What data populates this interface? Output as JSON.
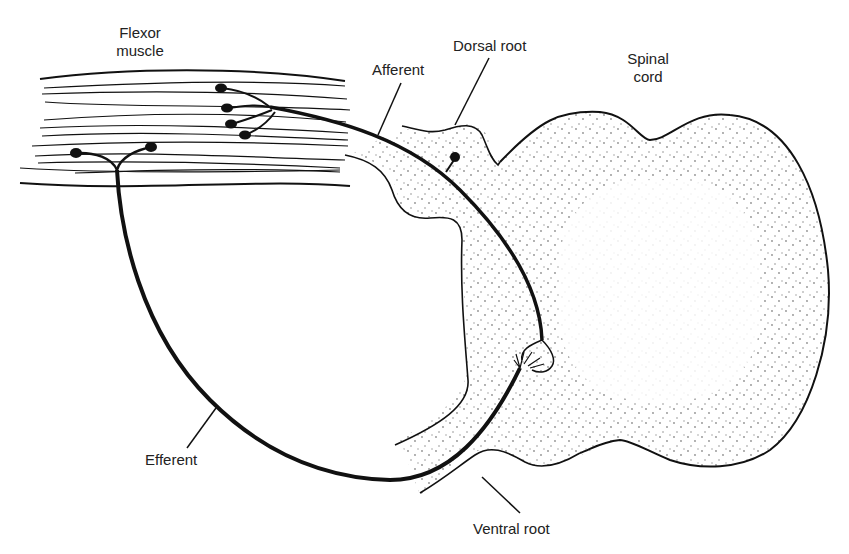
{
  "diagram": {
    "type": "spinal-reflex-arc",
    "labels": {
      "flexor_muscle_line1": "Flexor",
      "flexor_muscle_line2": "muscle",
      "afferent": "Afferent",
      "dorsal_root": "Dorsal root",
      "spinal_cord_line1": "Spinal",
      "spinal_cord_line2": "cord",
      "efferent": "Efferent",
      "ventral_root": "Ventral root"
    },
    "colors": {
      "line": "#111111",
      "stipple": "#333333",
      "background": "#ffffff",
      "text": "#222222"
    }
  }
}
